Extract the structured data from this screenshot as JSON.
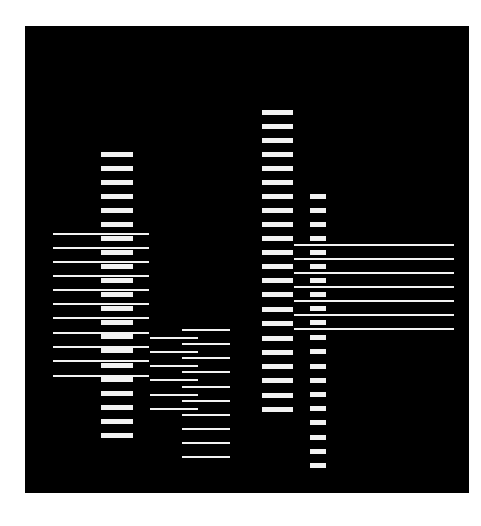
{
  "artwork": {
    "background_color": "#000000",
    "page_color": "#ffffff",
    "mark_color": "#f2f2f2",
    "canvas": {
      "x": 25,
      "y": 26,
      "width": 444,
      "height": 467
    },
    "groups": [
      {
        "name": "column-1-bars",
        "kind": "bar",
        "x": 101,
        "width": 32,
        "height": 5,
        "ys": [
          152,
          166,
          180,
          194,
          208,
          222,
          236,
          250,
          264,
          278,
          292,
          306,
          320,
          334,
          348,
          363,
          377,
          391,
          405,
          419,
          433
        ]
      },
      {
        "name": "left-lines",
        "kind": "line",
        "x": 53,
        "width": 96,
        "height": 2,
        "ys": [
          233,
          247,
          261,
          275,
          289,
          303,
          317,
          332,
          346,
          360,
          375
        ]
      },
      {
        "name": "middle-left-lines",
        "kind": "line",
        "x": 150,
        "width": 48,
        "height": 2,
        "ys": [
          337,
          351,
          365,
          379,
          394,
          408
        ]
      },
      {
        "name": "middle-right-lines",
        "kind": "line",
        "x": 182,
        "width": 48,
        "height": 2,
        "ys": [
          329,
          343,
          357,
          371,
          386,
          400,
          414,
          428,
          442,
          456
        ]
      },
      {
        "name": "column-3-bars",
        "kind": "bar",
        "x": 262,
        "width": 31,
        "height": 5,
        "ys": [
          110,
          124,
          138,
          152,
          166,
          180,
          194,
          208,
          222,
          236,
          250,
          264,
          278,
          292,
          307,
          321,
          336,
          350,
          364,
          378,
          393,
          407
        ]
      },
      {
        "name": "column-4-bars",
        "kind": "bar",
        "x": 310,
        "width": 16,
        "height": 5,
        "ys": [
          194,
          208,
          222,
          236,
          250,
          264,
          278,
          292,
          306,
          320,
          335,
          349,
          364,
          378,
          392,
          406,
          420,
          435,
          449,
          463
        ]
      },
      {
        "name": "right-lines",
        "kind": "line",
        "x": 294,
        "width": 160,
        "height": 2,
        "ys": [
          244,
          258,
          272,
          286,
          300,
          314,
          328
        ]
      }
    ]
  }
}
